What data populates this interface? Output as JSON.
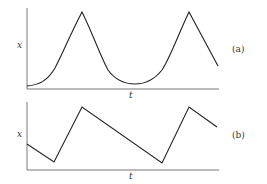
{
  "figure": {
    "panels": [
      {
        "id": "a",
        "panel_label": "(a)",
        "y_label": "x",
        "x_label": "t",
        "description": "Smooth exponential rise to sharp peaks, with rounded troughs"
      },
      {
        "id": "b",
        "panel_label": "(b)",
        "y_label": "x",
        "x_label": "t",
        "description": "Sawtooth: steep rises, slow linear decays"
      }
    ]
  },
  "colors": {
    "line": "#222222",
    "axis": "#666666",
    "text": "#333333"
  }
}
